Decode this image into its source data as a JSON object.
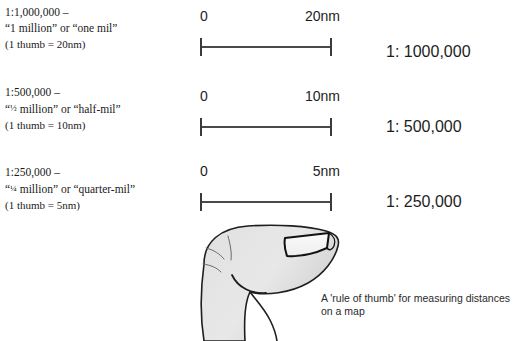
{
  "figure": {
    "caption": "A 'rule of thumb' for measuring distances on a map",
    "background_color": "#ffffff",
    "ink_color": "#1a1a1a"
  },
  "scales": [
    {
      "ratio_heading": "1:1,000,000 –",
      "nickname": "“1 million” or “one mil”",
      "thumb_note": "(1 thumb = 20nm)",
      "bar_start_label": "0",
      "bar_end_label": "20nm",
      "ratio_label": "1: 1000,000"
    },
    {
      "ratio_heading": "1:500,000 –",
      "nickname_prefix": "“",
      "nickname_fraction": "½",
      "nickname_rest": " million” or “half-mil”",
      "thumb_note": "(1 thumb = 10nm)",
      "bar_start_label": "0",
      "bar_end_label": "10nm",
      "ratio_label": "1: 500,000"
    },
    {
      "ratio_heading": "1:250,000 –",
      "nickname_prefix": "“",
      "nickname_fraction": "¼",
      "nickname_rest": " million” or “quarter-mil”",
      "thumb_note": "(1 thumb = 5nm)",
      "bar_start_label": "0",
      "bar_end_label": "5nm",
      "ratio_label": "1: 250,000"
    }
  ],
  "thumb": {
    "icon_name": "thumb-illustration",
    "fill_color": "#e3e3e3",
    "outline_color": "#1a1a1a",
    "nail_fill": "#f4f4f4"
  }
}
